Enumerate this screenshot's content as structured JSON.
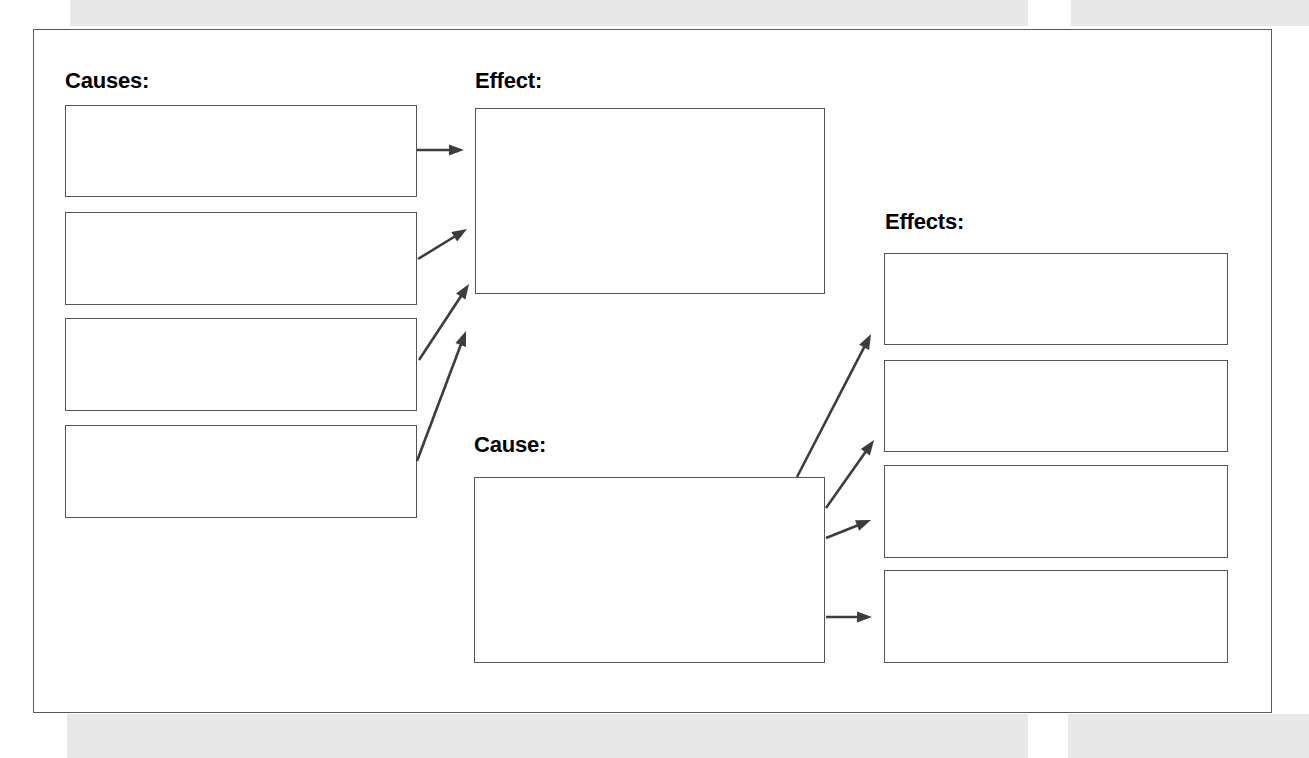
{
  "worksheet": {
    "type": "cause-and-effect-graphic-organizer",
    "page_background": "#ffffff",
    "frame_border_color": "#5a5a5a",
    "box_border_color": "#555555",
    "arrow_color": "#3d3d3d",
    "scan_band_color": "#e8e8e8"
  },
  "sections": {
    "causes": {
      "label": "Causes:",
      "boxes": [
        {
          "name": "cause-box-1",
          "value": "",
          "placeholder": ""
        },
        {
          "name": "cause-box-2",
          "value": "",
          "placeholder": ""
        },
        {
          "name": "cause-box-3",
          "value": "",
          "placeholder": ""
        },
        {
          "name": "cause-box-4",
          "value": "",
          "placeholder": ""
        }
      ]
    },
    "effect": {
      "label": "Effect:",
      "boxes": [
        {
          "name": "effect-box",
          "value": "",
          "placeholder": ""
        }
      ]
    },
    "cause": {
      "label": "Cause:",
      "boxes": [
        {
          "name": "cause-big-box",
          "value": "",
          "placeholder": ""
        }
      ]
    },
    "effects": {
      "label": "Effects:",
      "boxes": [
        {
          "name": "effect-box-1",
          "value": "",
          "placeholder": ""
        },
        {
          "name": "effect-box-2",
          "value": "",
          "placeholder": ""
        },
        {
          "name": "effect-box-3",
          "value": "",
          "placeholder": ""
        },
        {
          "name": "effect-box-4",
          "value": "",
          "placeholder": ""
        }
      ]
    }
  },
  "arrows": [
    {
      "name": "arrow-cause1-to-effect",
      "from": "cause-box-1",
      "to": "effect-box",
      "x1": 417,
      "y1": 150,
      "x2": 464,
      "y2": 150
    },
    {
      "name": "arrow-cause2-to-effect",
      "from": "cause-box-2",
      "to": "effect-box",
      "x1": 418,
      "y1": 259,
      "x2": 467,
      "y2": 229
    },
    {
      "name": "arrow-cause3-to-effect",
      "from": "cause-box-3",
      "to": "effect-box",
      "x1": 419,
      "y1": 360,
      "x2": 469,
      "y2": 284
    },
    {
      "name": "arrow-cause4-to-effect",
      "from": "cause-box-4",
      "to": "effect-box",
      "x1": 417,
      "y1": 461,
      "x2": 466,
      "y2": 331
    },
    {
      "name": "arrow-cause-to-effect1",
      "from": "cause-big-box",
      "to": "effect-box-1",
      "x1": 797,
      "y1": 477,
      "x2": 871,
      "y2": 334
    },
    {
      "name": "arrow-cause-to-effect2",
      "from": "cause-big-box",
      "to": "effect-box-2",
      "x1": 826,
      "y1": 508,
      "x2": 874,
      "y2": 440
    },
    {
      "name": "arrow-cause-to-effect3",
      "from": "cause-big-box",
      "to": "effect-box-3",
      "x1": 826,
      "y1": 538,
      "x2": 871,
      "y2": 520
    },
    {
      "name": "arrow-cause-to-effect4",
      "from": "cause-big-box",
      "to": "effect-box-4",
      "x1": 826,
      "y1": 617,
      "x2": 872,
      "y2": 617
    }
  ]
}
